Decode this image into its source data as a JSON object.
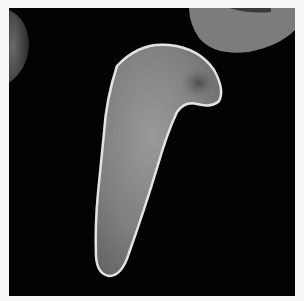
{
  "image": {
    "subject": "scanning electron micrograph of a sickle-shaped red blood cell",
    "background_color": "#020202",
    "frame_color": "#f7f7f7",
    "cell_color": "#8a8a8a",
    "cell_highlight_color": "#e8e8e8",
    "neighbor_cell_color": "#7a7a7a"
  }
}
